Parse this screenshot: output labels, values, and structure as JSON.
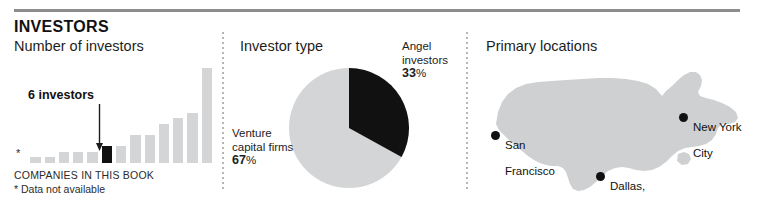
{
  "header": {
    "title": "INVESTORS"
  },
  "panels": {
    "investors": {
      "title": "Number of investors",
      "callout": "6 investors",
      "footnote_main": "COMPANIES IN THIS BOOK",
      "footnote_note": "* Data not available",
      "star_symbol": "*"
    },
    "investor_type": {
      "title": "Investor type"
    },
    "locations": {
      "title": "Primary locations"
    }
  },
  "colors": {
    "bar_gray": "#d4d5d6",
    "bar_highlight": "#111111",
    "pie_gray": "#d4d5d6",
    "pie_dark": "#111111",
    "map_gray": "#cfd0d1",
    "rule": "#8b8d8f",
    "divider": "#b4b6b8"
  },
  "chart_data": [
    {
      "type": "bar",
      "title": "Number of investors",
      "xlabel": "COMPANIES IN THIS BOOK",
      "ylabel": "",
      "ylim": [
        0,
        18
      ],
      "grid": false,
      "legend": "none",
      "annotations": [
        "6 investors",
        "* Data not available"
      ],
      "categories": [
        "*",
        "c1",
        "c2",
        "c3",
        "c4",
        "c5",
        "c6",
        "c7",
        "c8",
        "c9",
        "c10",
        "c11",
        "c12",
        "c13"
      ],
      "values": [
        0,
        1,
        1,
        2,
        2,
        2,
        3,
        3,
        5,
        5,
        7,
        8,
        9,
        17
      ],
      "highlight_index": 6,
      "highlight_value": 6
    },
    {
      "type": "pie",
      "title": "Investor type",
      "labels": [
        "Angel investors",
        "Venture capital firms"
      ],
      "values": [
        33,
        67
      ],
      "display_values": [
        "33%",
        "67%"
      ],
      "slice_colors": [
        "#111111",
        "#d4d5d6"
      ],
      "start_angle_deg": 0,
      "legend": "callout-labels"
    },
    {
      "type": "map",
      "title": "Primary locations",
      "region": "United States",
      "points": [
        {
          "label": "San\nFrancisco",
          "x_pct": 7,
          "y_pct": 55
        },
        {
          "label": "Dallas,\nTX",
          "x_pct": 43,
          "y_pct": 84
        },
        {
          "label": "New York\nCity",
          "x_pct": 76,
          "y_pct": 45
        }
      ]
    }
  ],
  "pie_labels": {
    "angel": {
      "line1": "Angel",
      "line2": "investors",
      "value": "33",
      "symbol": "%"
    },
    "venture": {
      "line1": "Venture",
      "line2": "capital firms",
      "value": "67",
      "symbol": "%"
    }
  },
  "map_points": [
    {
      "name": "san-francisco",
      "line1": "San",
      "line2": "Francisco"
    },
    {
      "name": "dallas",
      "line1": "Dallas,",
      "line2": "TX"
    },
    {
      "name": "new-york-city",
      "line1": "New York",
      "line2": "City"
    }
  ]
}
